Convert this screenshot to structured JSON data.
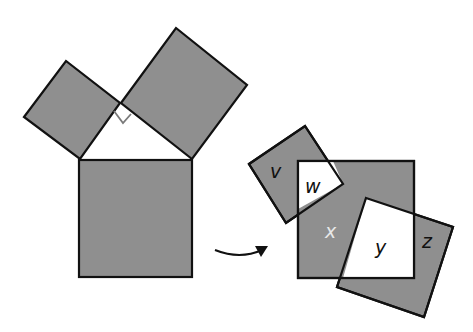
{
  "diagram": {
    "colors": {
      "fill": "#8f8f8f",
      "stroke": "#111111",
      "white": "#ffffff",
      "right_angle_marker": "#7a7a7a",
      "x_label": "#e8e8e8"
    },
    "left_figure": {
      "small_square": "24,117 66,61 120,103 80,159",
      "large_square": "121,103 176,28 247,85 192,159",
      "hypotenuse_square": {
        "x": 79,
        "y": 160,
        "w": 113,
        "h": 117
      },
      "triangle": "80,159 120,103 192,159",
      "right_angle_marker": "114,111 123,123 131,114"
    },
    "arrow": {
      "path": "M215,250 Q240,260 262,250",
      "head": "268,246 255,246 261,257"
    },
    "right_figure": {
      "big_square": {
        "x": 298,
        "y": 161,
        "w": 116,
        "h": 117
      },
      "square_v": "249,164 305,126 343,184 286,223",
      "square_z": "366,198 453,227 424,317 337,287",
      "region_w": "298,161 333,161 343,184 298,209",
      "region_y": "366,198 414,214 414,278 343,278"
    },
    "labels": {
      "v": "v",
      "w": "w",
      "x": "x",
      "y": "y",
      "z": "z"
    }
  }
}
